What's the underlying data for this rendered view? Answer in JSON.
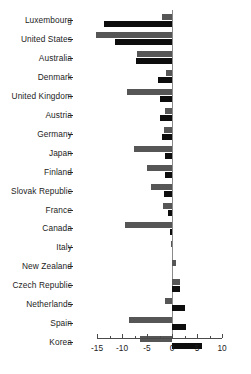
{
  "chart_data": {
    "type": "bar",
    "orientation": "horizontal",
    "title": "",
    "subtitle": "",
    "xlabel": "",
    "ylabel": "",
    "xlim": [
      -15,
      10
    ],
    "xticks": [
      -15,
      -10,
      -5,
      0,
      5,
      10
    ],
    "xticklabels": [
      "-15",
      "-10",
      "-5",
      "0",
      "5",
      "10"
    ],
    "minor_tick_step": 2.5,
    "grid": false,
    "legend": "none",
    "categories": [
      "Luxembourg",
      "United States",
      "Australia",
      "Denmark",
      "United Kingdom",
      "Austria",
      "Germany",
      "Japan",
      "Finland",
      "Slovak Republic",
      "France",
      "Canada",
      "Italy",
      "New Zealand",
      "Czech Republic",
      "Netherlands",
      "Spain",
      "Korea"
    ],
    "series": [
      {
        "name": "series-gray",
        "color": "#565656",
        "values": [
          -2.0,
          -15.2,
          -7.0,
          -1.2,
          -9.0,
          -1.4,
          -1.6,
          -7.6,
          -5.0,
          -4.2,
          -1.8,
          -9.4,
          -0.2,
          0.8,
          1.6,
          -1.4,
          -8.6,
          -6.4
        ]
      },
      {
        "name": "series-black",
        "color": "#0d0d0d",
        "values": [
          -13.6,
          -11.4,
          -7.2,
          -2.8,
          -2.4,
          -2.4,
          -2.0,
          -1.4,
          -1.4,
          -1.6,
          -0.8,
          -0.4,
          0.0,
          0.0,
          1.6,
          2.6,
          2.8,
          6.0
        ]
      }
    ],
    "colors": {
      "gray": "#565656",
      "black": "#0d0d0d",
      "axis": "#4a4a4a",
      "zero_line": "#8a8a8a",
      "text": "#1c1c1c",
      "background": "#ffffff"
    }
  }
}
